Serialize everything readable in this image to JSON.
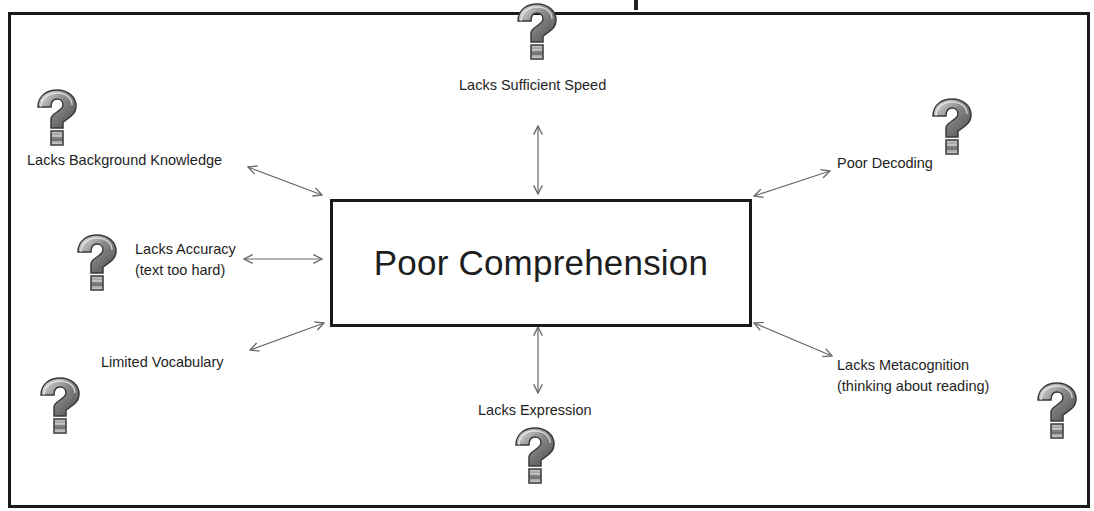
{
  "diagram": {
    "center": {
      "label": "Poor Comprehension"
    },
    "causes": [
      {
        "id": "background",
        "label": "Lacks Background Knowledge",
        "sublabel": ""
      },
      {
        "id": "speed",
        "label": "Lacks Sufficient Speed",
        "sublabel": ""
      },
      {
        "id": "decoding",
        "label": "Poor Decoding",
        "sublabel": ""
      },
      {
        "id": "accuracy",
        "label": "Lacks Accuracy",
        "sublabel": "(text too hard)"
      },
      {
        "id": "vocabulary",
        "label": "Limited Vocabulary",
        "sublabel": ""
      },
      {
        "id": "expression",
        "label": "Lacks Expression",
        "sublabel": ""
      },
      {
        "id": "metacognition",
        "label": "Lacks Metacognition",
        "sublabel": "(thinking about reading)"
      }
    ],
    "icon": "question-mark-icon",
    "colors": {
      "border": "#1a1a1a",
      "arrow": "#666666",
      "text": "#1e1e1e",
      "icon_dark": "#5a5a5a",
      "icon_light": "#d9d9d9"
    }
  }
}
